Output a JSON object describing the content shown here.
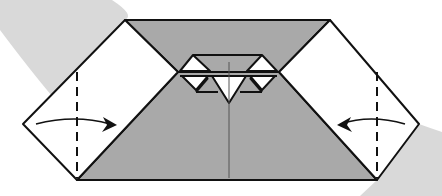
{
  "diagram": {
    "type": "origami-fold-step",
    "colors": {
      "background": "#ffffff",
      "swoosh": "#d9d9d9",
      "paper_colored_side": "#a9a9a9",
      "paper_white_side": "#ffffff",
      "line": "#111111",
      "center_crease": "#555555"
    },
    "folds": [
      {
        "side": "left",
        "type": "valley-fold",
        "arrow_direction": "right"
      },
      {
        "side": "right",
        "type": "valley-fold",
        "arrow_direction": "left"
      }
    ],
    "labels": []
  }
}
